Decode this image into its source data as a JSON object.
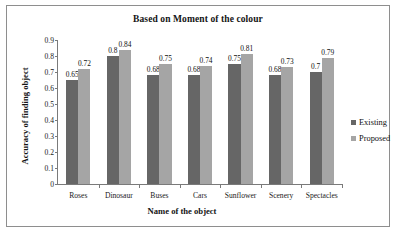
{
  "figure": {
    "border_color": "#8e8e8e",
    "background": "#ffffff"
  },
  "legend": {
    "position": "right",
    "entries": [
      {
        "label": "Existing",
        "color": "#666666"
      },
      {
        "label": "Proposed",
        "color": "#a5a5a5"
      }
    ]
  },
  "chart_data": {
    "type": "bar",
    "title": "Based on Moment of the colour",
    "xlabel": "Name of the object",
    "ylabel": "Accuracy of finding object",
    "categories": [
      "Roses",
      "Dinosaur",
      "Buses",
      "Cars",
      "Sunflower",
      "Scenery",
      "Spectacles"
    ],
    "series": [
      {
        "name": "Existing",
        "color": "#666666",
        "values": [
          0.65,
          0.8,
          0.68,
          0.68,
          0.75,
          0.68,
          0.7
        ],
        "labels": [
          "0.65",
          "0.8",
          "0.68",
          "0.68",
          "0.75",
          "0.68",
          "0.7"
        ]
      },
      {
        "name": "Proposed",
        "color": "#a5a5a5",
        "values": [
          0.72,
          0.84,
          0.75,
          0.74,
          0.81,
          0.73,
          0.79
        ],
        "labels": [
          "0.72",
          "0.84",
          "0.75",
          "0.74",
          "0.81",
          "0.73",
          "0.79"
        ]
      }
    ],
    "ylim": [
      0,
      0.9
    ],
    "yticks": [
      0,
      0.1,
      0.2,
      0.3,
      0.4,
      0.5,
      0.6,
      0.7,
      0.8,
      0.9
    ],
    "ytick_labels": [
      "0",
      "0.1",
      "0.2",
      "0.3",
      "0.4",
      "0.5",
      "0.6",
      "0.7",
      "0.8",
      "0.9"
    ],
    "grid": false,
    "legend_position": "right"
  }
}
